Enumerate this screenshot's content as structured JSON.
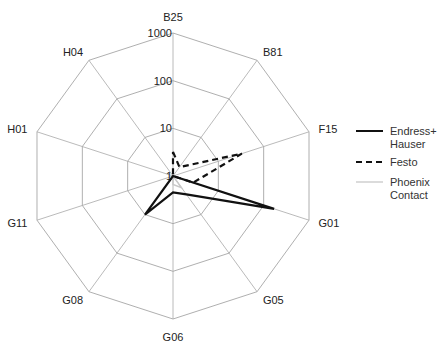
{
  "chart_data": {
    "type": "radar",
    "title": "",
    "scale": "log",
    "rlim": [
      1,
      1000
    ],
    "ticks": [
      "1",
      "10",
      "100",
      "1000"
    ],
    "categories": [
      "B25",
      "B81",
      "F15",
      "G01",
      "G05",
      "G06",
      "G08",
      "G11",
      "H01",
      "H04"
    ],
    "series": [
      {
        "name": "Endress+ Hauser",
        "style": "solid",
        "color": "#111111",
        "width": 2.2,
        "values": [
          1,
          1,
          1,
          170,
          3,
          2.2,
          10,
          1,
          1,
          1
        ]
      },
      {
        "name": "Festo",
        "style": "dashed",
        "color": "#111111",
        "width": 2.2,
        "values": [
          3.2,
          1.7,
          33,
          2.8,
          1,
          1,
          1,
          1,
          1,
          1
        ]
      },
      {
        "name": "Phoenix Contact",
        "style": "solid",
        "color": "#c8c8c8",
        "width": 1.5,
        "values": [
          1,
          1,
          1,
          1,
          2,
          1.5,
          1,
          1,
          1,
          1
        ]
      }
    ],
    "grid": true,
    "legend_position": "right"
  },
  "legend": {
    "items": [
      {
        "line1": "Endress+",
        "line2": "Hauser"
      },
      {
        "line1": "Festo",
        "line2": ""
      },
      {
        "line1": "Phoenix",
        "line2": "Contact"
      }
    ]
  }
}
